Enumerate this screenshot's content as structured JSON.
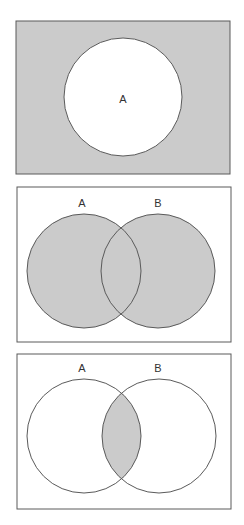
{
  "colors": {
    "shade": "#cbcbcb",
    "background": "#ffffff",
    "stroke": "#5a5a5a",
    "text": "#333333"
  },
  "diagrams": [
    {
      "id": "complement-of-A",
      "description": "Universe shaded, circle A unshaded (complement of A)",
      "shaded_region": "U \\ A",
      "box": {
        "x": 16,
        "y": 21,
        "w": 214,
        "h": 153
      },
      "circles": [
        {
          "label": "A",
          "cx": 123,
          "cy": 97,
          "r": 59,
          "label_x": 123,
          "label_y": 99
        }
      ]
    },
    {
      "id": "union-A-B",
      "description": "Circles A and B both shaded (A union B)",
      "shaded_region": "A ∪ B",
      "box": {
        "x": 17,
        "y": 187,
        "w": 214,
        "h": 155
      },
      "circles": [
        {
          "label": "A",
          "cx": 84,
          "cy": 271,
          "r": 57,
          "label_x": 82,
          "label_y": 203
        },
        {
          "label": "B",
          "cx": 158,
          "cy": 271,
          "r": 57,
          "label_x": 158,
          "label_y": 203
        }
      ]
    },
    {
      "id": "intersection-A-B",
      "description": "Only the overlap of A and B shaded (A intersect B)",
      "shaded_region": "A ∩ B",
      "box": {
        "x": 17,
        "y": 354,
        "w": 214,
        "h": 155
      },
      "circles": [
        {
          "label": "A",
          "cx": 84,
          "cy": 436,
          "r": 57,
          "label_x": 82,
          "label_y": 368
        },
        {
          "label": "B",
          "cx": 159,
          "cy": 436,
          "r": 57,
          "label_x": 158,
          "label_y": 368
        }
      ]
    }
  ]
}
